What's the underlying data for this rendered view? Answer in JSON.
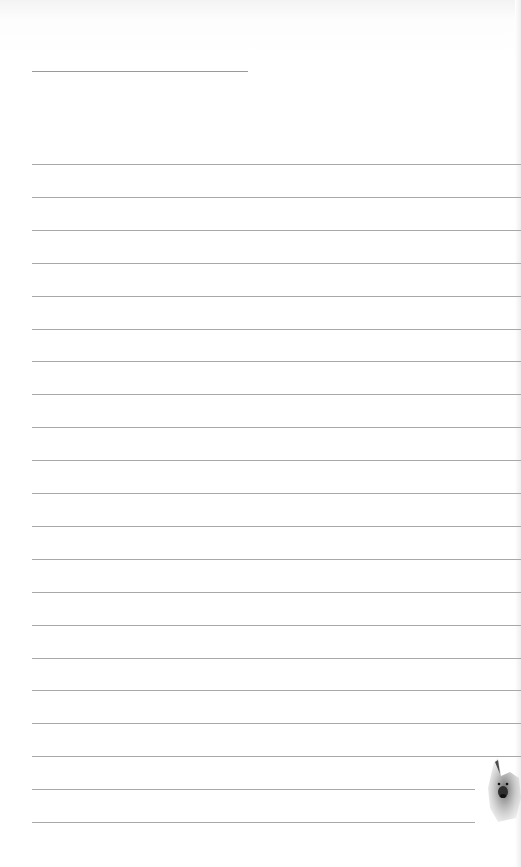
{
  "page": {
    "type": "lined writing paper",
    "title_line": {
      "x": 32,
      "y": 71,
      "width": 216
    },
    "ruled_lines": {
      "count": 21,
      "start_y": 164,
      "spacing": 32.9,
      "full_width_until": 19,
      "short_width": 443
    },
    "colors": {
      "background": "#ffffff",
      "line": "#a8a8a8"
    },
    "decoration": {
      "icon": "german-shepherd-dog-icon",
      "position": "bottom-right"
    }
  }
}
